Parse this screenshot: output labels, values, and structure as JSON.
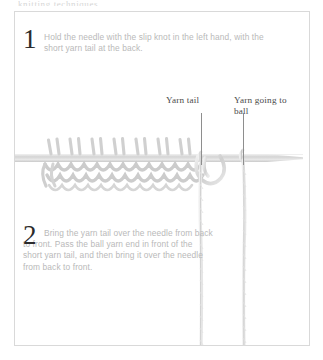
{
  "page": {
    "top_cut_text": "knitting techniques",
    "background_color": "#ffffff",
    "frame_color": "#d9d9d9"
  },
  "steps": [
    {
      "number": "1",
      "text": "Hold the needle with the slip knot in the left hand, with the short yarn tail at the back."
    },
    {
      "number": "2",
      "text": "Bring the yarn tail over the needle from back to front. Pass the ball yarn end in front of the short yarn tail, and then bring it over the needle from back to front."
    }
  ],
  "callouts": [
    {
      "label": "Yarn tail"
    },
    {
      "label": "Yarn going to ball"
    }
  ],
  "illustration": {
    "name": "knitting-needle-with-stitches",
    "needle_color": "#dcdcdc",
    "yarn_color": "#d2d2d2",
    "stitch_count": 9
  }
}
